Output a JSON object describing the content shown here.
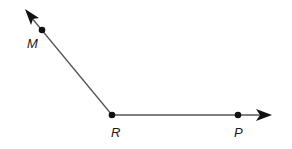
{
  "diagram": {
    "vertex": {
      "label": "R",
      "x": 112,
      "y": 115
    },
    "points": [
      {
        "label": "M",
        "x": 42,
        "y": 30,
        "label_x": 27,
        "label_y": 48
      },
      {
        "label": "R",
        "x": 112,
        "y": 115,
        "label_x": 111,
        "label_y": 137
      },
      {
        "label": "P",
        "x": 238,
        "y": 115,
        "label_x": 234,
        "label_y": 137
      }
    ],
    "rays": [
      {
        "name": "ray-RM",
        "from": "R",
        "through": "M",
        "tip_x": 25,
        "tip_y": 9
      },
      {
        "name": "ray-RP",
        "from": "R",
        "through": "P",
        "tip_x": 272,
        "tip_y": 115
      }
    ],
    "colors": {
      "line": "#555555",
      "point": "#111111",
      "label": "#1a1a1a"
    }
  }
}
